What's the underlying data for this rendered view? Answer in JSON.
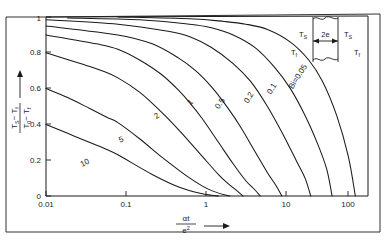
{
  "figure": {
    "title": "",
    "border": true
  },
  "axes": {
    "x": {
      "label_numerator": "αt",
      "label_denominator": "e",
      "label_denominator_exp": "2",
      "scale": "log",
      "range": [
        0.01,
        300
      ],
      "ticks": [
        "0.01",
        "0.1",
        "1",
        "10",
        "100"
      ],
      "tick_values": [
        0.01,
        0.1,
        1,
        10,
        100
      ],
      "arrow": true
    },
    "y": {
      "label_numerator": "T",
      "label_numerator_sub1": "S",
      "label_numerator_minus": "− T",
      "label_numerator_sub2": "f",
      "label_denominator": "T",
      "label_denominator_sub1": "0",
      "label_denominator_minus": "− T",
      "label_denominator_sub2": "f",
      "scale": "linear",
      "range": [
        0,
        1
      ],
      "ticks": [
        "0",
        "0.2",
        "0.4",
        "0.6",
        "0.8",
        "1"
      ],
      "tick_values": [
        0,
        0.2,
        0.4,
        0.6,
        0.8,
        1.0
      ],
      "arrow": true
    }
  },
  "inset": {
    "name": "slab-diagram",
    "thickness_label": "2e",
    "surface_temp_left": "T",
    "surface_temp_left_sub": "S",
    "surface_temp_right": "T",
    "surface_temp_right_sub": "S",
    "fluid_temp_left": "T",
    "fluid_temp_left_sub": "f",
    "fluid_temp_right": "T",
    "fluid_temp_right_sub": "f"
  },
  "curve_labels": [
    {
      "text": "10",
      "x": 88,
      "y": 163,
      "rotate": -30
    },
    {
      "text": "5",
      "x": 119,
      "y": 139,
      "rotate": -42
    },
    {
      "text": "2",
      "x": 155,
      "y": 121,
      "rotate": -52
    },
    {
      "text": "1",
      "x": 188,
      "y": 110,
      "rotate": -57
    },
    {
      "text": "0.5",
      "x": 218,
      "y": 112,
      "rotate": -60
    },
    {
      "text": "0.2",
      "x": 249,
      "y": 108,
      "rotate": -60
    },
    {
      "text": "0.1",
      "x": 273,
      "y": 100,
      "rotate": -60
    },
    {
      "text": "Bi=0.05",
      "x": 293,
      "y": 90,
      "rotate": -60
    }
  ],
  "chart_data": {
    "type": "line",
    "title": "",
    "xlabel": "αt/e²",
    "ylabel": "(T_S - T_f)/(T_0 - T_f)",
    "xscale": "log",
    "yscale": "linear",
    "xlim": [
      0.01,
      300
    ],
    "ylim": [
      0,
      1
    ],
    "grid": false,
    "legend": "inline-curve-labels",
    "series": [
      {
        "name": "Bi = 10",
        "label": "10",
        "x": [
          0.01,
          0.02,
          0.04,
          0.07,
          0.1,
          0.2,
          0.3,
          0.5,
          0.7,
          1.0,
          1.5,
          2.0,
          2.5
        ],
        "y": [
          0.4,
          0.35,
          0.3,
          0.26,
          0.23,
          0.16,
          0.12,
          0.075,
          0.05,
          0.03,
          0.012,
          0.004,
          0.0
        ]
      },
      {
        "name": "Bi = 5",
        "label": "5",
        "x": [
          0.01,
          0.02,
          0.04,
          0.07,
          0.1,
          0.2,
          0.4,
          0.7,
          1.0,
          1.5,
          2.0,
          3.0,
          3.6
        ],
        "y": [
          0.6,
          0.55,
          0.49,
          0.44,
          0.41,
          0.32,
          0.22,
          0.145,
          0.1,
          0.055,
          0.03,
          0.007,
          0.0
        ]
      },
      {
        "name": "Bi = 2",
        "label": "2",
        "x": [
          0.01,
          0.03,
          0.06,
          0.1,
          0.2,
          0.4,
          0.7,
          1.0,
          1.5,
          2.5,
          3.5,
          4.5,
          5.5
        ],
        "y": [
          0.8,
          0.74,
          0.7,
          0.66,
          0.58,
          0.47,
          0.37,
          0.3,
          0.22,
          0.12,
          0.065,
          0.03,
          0.0
        ]
      },
      {
        "name": "Bi = 1",
        "label": "1",
        "x": [
          0.01,
          0.05,
          0.1,
          0.2,
          0.4,
          0.7,
          1.0,
          1.5,
          2.5,
          4.0,
          6.0,
          8.0,
          9.5
        ],
        "y": [
          0.9,
          0.85,
          0.82,
          0.76,
          0.68,
          0.59,
          0.52,
          0.43,
          0.3,
          0.18,
          0.085,
          0.035,
          0.0
        ]
      },
      {
        "name": "Bi = 0.5",
        "label": "0.5",
        "x": [
          0.01,
          0.1,
          0.3,
          0.7,
          1.2,
          2.0,
          3.0,
          5.0,
          8.0,
          12.0,
          16.0,
          19.0
        ],
        "y": [
          0.95,
          0.9,
          0.85,
          0.77,
          0.7,
          0.61,
          0.52,
          0.39,
          0.25,
          0.13,
          0.055,
          0.0
        ]
      },
      {
        "name": "Bi = 0.2",
        "label": "0.2",
        "x": [
          0.01,
          0.1,
          0.5,
          1.0,
          2.0,
          4.0,
          7.0,
          12.0,
          20.0,
          30.0,
          40.0,
          48.0
        ],
        "y": [
          0.985,
          0.96,
          0.92,
          0.89,
          0.83,
          0.74,
          0.64,
          0.5,
          0.34,
          0.2,
          0.1,
          0.0
        ]
      },
      {
        "name": "Bi = 0.1",
        "label": "0.1",
        "x": [
          0.02,
          0.2,
          1.0,
          2.0,
          4.0,
          8.0,
          15.0,
          25.0,
          40.0,
          60.0,
          80.0,
          95.0
        ],
        "y": [
          0.995,
          0.985,
          0.96,
          0.94,
          0.9,
          0.83,
          0.72,
          0.6,
          0.45,
          0.29,
          0.15,
          0.0
        ]
      },
      {
        "name": "Bi = 0.05",
        "label": "Bi=0.05",
        "x": [
          0.1,
          1.0,
          3.0,
          6.0,
          12.0,
          25.0,
          45.0,
          70.0,
          110.0,
          160.0,
          200.0
        ],
        "y": [
          1.0,
          0.99,
          0.975,
          0.96,
          0.93,
          0.86,
          0.76,
          0.64,
          0.45,
          0.22,
          0.0
        ]
      }
    ]
  }
}
